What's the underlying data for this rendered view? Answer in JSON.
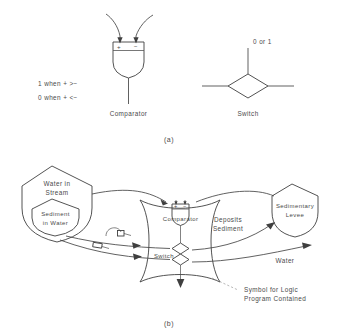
{
  "figure": {
    "panel_a": {
      "label": "(a)",
      "comparator": {
        "caption": "Comparator",
        "plus": "+",
        "minus": "−",
        "rule_high": "1 when + >−",
        "rule_low": "0 when + <−"
      },
      "switch": {
        "caption": "Switch",
        "state_label": "0 or 1"
      }
    },
    "panel_b": {
      "label": "(b)",
      "nodes": [
        {
          "id": "water-in-stream",
          "label_line1": "Water in",
          "label_line2": "Stream"
        },
        {
          "id": "sediment-in-water",
          "label_line1": "Sediment",
          "label_line2": "in Water"
        },
        {
          "id": "sedimentary-levee",
          "label_line1": "Sedimentary",
          "label_line2": "Levee"
        }
      ],
      "inner": {
        "comparator_caption": "Comparator",
        "switch_caption": "Switch",
        "plus": "+",
        "minus": "−"
      },
      "flow_labels": {
        "deposits_line1": "Deposits",
        "deposits_line2": "Sediment",
        "water": "Water"
      },
      "annotation": {
        "line1": "Symbol for Logic",
        "line2": "Program Contained"
      }
    }
  },
  "colors": {
    "background": "#ffffff",
    "stroke": "#3f3f3f",
    "text": "#4a4a4a",
    "annotation_leader": "#9a9a9a"
  }
}
